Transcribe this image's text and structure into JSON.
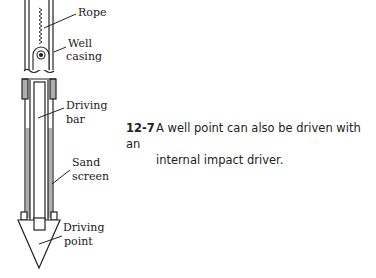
{
  "figure": {
    "labels": {
      "rope": "Rope",
      "well_casing_1": "Well",
      "well_casing_2": "casing",
      "driving_bar_1": "Driving",
      "driving_bar_2": "bar",
      "sand_screen_1": "Sand",
      "sand_screen_2": "screen",
      "driving_point_1": "Driving",
      "driving_point_2": "point"
    }
  },
  "caption": {
    "number": "12-7",
    "line1": "A well point can also be driven with an",
    "line2": "internal impact driver."
  }
}
